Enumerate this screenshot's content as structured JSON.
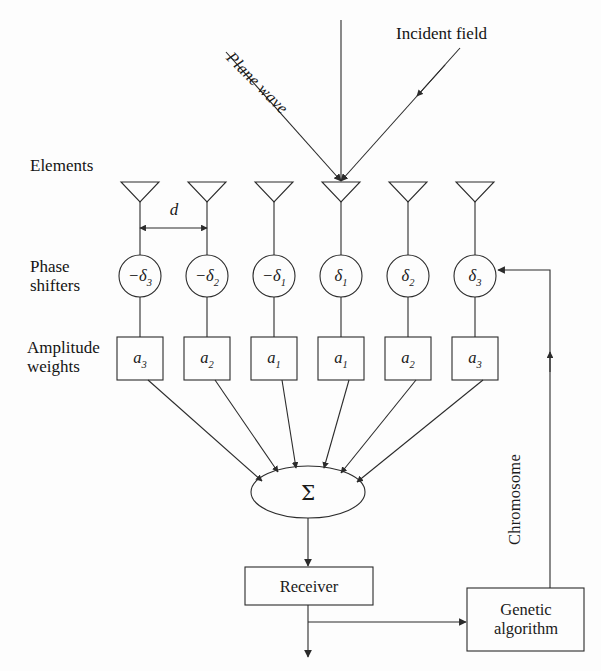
{
  "figure": {
    "title_alt": "Adaptive phased array antenna with genetic algorithm control",
    "background": "#fdfdfd",
    "stroke": "#2b2b2b"
  },
  "annotations": {
    "incident_field": "Incident field",
    "plane_wave": "Plane wave",
    "chromosome": "Chromosome",
    "spacing": "d"
  },
  "row_labels": {
    "elements": "Elements",
    "phase_shifters_line1": "Phase",
    "phase_shifters_line2": "shifters",
    "amplitude_line1": "Amplitude",
    "amplitude_line2": "weights"
  },
  "elements": [
    {
      "id": "el-1",
      "cx": 140
    },
    {
      "id": "el-2",
      "cx": 207
    },
    {
      "id": "el-3",
      "cx": 274
    },
    {
      "id": "el-4",
      "cx": 341
    },
    {
      "id": "el-5",
      "cx": 408
    },
    {
      "id": "el-6",
      "cx": 475
    }
  ],
  "phase_shifters": [
    {
      "id": "ps-1",
      "cx": 140,
      "sign": "−",
      "symbol": "δ",
      "index": "3",
      "label": "−δ₃"
    },
    {
      "id": "ps-2",
      "cx": 207,
      "sign": "−",
      "symbol": "δ",
      "index": "2",
      "label": "−δ₂"
    },
    {
      "id": "ps-3",
      "cx": 274,
      "sign": "−",
      "symbol": "δ",
      "index": "1",
      "label": "−δ₁"
    },
    {
      "id": "ps-4",
      "cx": 341,
      "sign": "",
      "symbol": "δ",
      "index": "1",
      "label": "δ₁"
    },
    {
      "id": "ps-5",
      "cx": 408,
      "sign": "",
      "symbol": "δ",
      "index": "2",
      "label": "δ₂"
    },
    {
      "id": "ps-6",
      "cx": 475,
      "sign": "",
      "symbol": "δ",
      "index": "3",
      "label": "δ₃"
    }
  ],
  "amplitude_weights": [
    {
      "id": "aw-1",
      "cx": 140,
      "symbol": "a",
      "index": "3",
      "label": "a₃"
    },
    {
      "id": "aw-2",
      "cx": 207,
      "symbol": "a",
      "index": "2",
      "label": "a₂"
    },
    {
      "id": "aw-3",
      "cx": 274,
      "symbol": "a",
      "index": "1",
      "label": "a₁"
    },
    {
      "id": "aw-4",
      "cx": 341,
      "symbol": "a",
      "index": "1",
      "label": "a₁"
    },
    {
      "id": "aw-5",
      "cx": 408,
      "symbol": "a",
      "index": "2",
      "label": "a₂"
    },
    {
      "id": "aw-6",
      "cx": 475,
      "symbol": "a",
      "index": "3",
      "label": "a₃"
    }
  ],
  "summation": {
    "symbol": "Σ",
    "cx": 308,
    "cy": 492,
    "rx": 57,
    "ry": 26
  },
  "receiver": {
    "label": "Receiver",
    "x": 245,
    "y": 567,
    "w": 128,
    "h": 38
  },
  "genetic_algorithm": {
    "line1": "Genetic",
    "line2": "algorithm",
    "x": 467,
    "y": 588,
    "w": 117,
    "h": 63
  }
}
